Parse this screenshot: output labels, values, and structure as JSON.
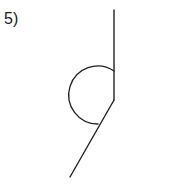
{
  "figure": {
    "label": "5)",
    "background_color": "#ffffff",
    "stroke_color": "#222222",
    "label_color": "#1a1a1a",
    "width": 196,
    "height": 185
  },
  "geometry": {
    "vertex": {
      "x": 114,
      "y": 100
    },
    "ray_up": {
      "x": 114,
      "y": 10
    },
    "ray_lower_left": {
      "x": 70,
      "y": 177
    },
    "arc": {
      "radius": 29,
      "start": {
        "x": 114,
        "y": 71
      },
      "end": {
        "x": 98,
        "y": 124
      },
      "sweep": "counterclockwise",
      "type": "reflex-angle-marker"
    },
    "stroke_width": 1.4
  },
  "chart_data": {
    "type": "diagram",
    "title": "5)",
    "elements": [
      {
        "name": "vertical-ray",
        "from": [
          114,
          100
        ],
        "to": [
          114,
          10
        ]
      },
      {
        "name": "oblique-ray",
        "from": [
          114,
          100
        ],
        "to": [
          70,
          177
        ]
      },
      {
        "name": "reflex-arc",
        "center": [
          114,
          100
        ],
        "radius": 29
      }
    ]
  }
}
